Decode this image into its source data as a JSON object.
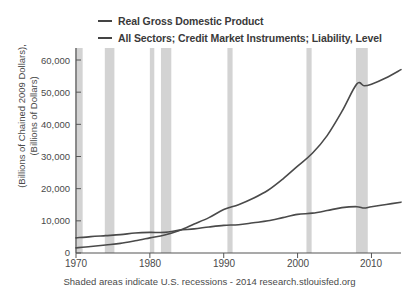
{
  "chart_data": {
    "type": "line",
    "title": "",
    "xlabel": "",
    "ylabel": "(Billions of Chained 2009 Dollars), (Billions of Dollars)",
    "ylabel_line1": "(Billions of Chained 2009 Dollars),",
    "ylabel_line2": "(Billions of Dollars)",
    "xlim": [
      1970,
      2014
    ],
    "ylim": [
      0,
      60000
    ],
    "grid": false,
    "legend_position": "top",
    "yticks": [
      "0",
      "10,000",
      "20,000",
      "30,000",
      "40,000",
      "50,000",
      "60,000"
    ],
    "ytick_values": [
      0,
      10000,
      20000,
      30000,
      40000,
      50000,
      60000
    ],
    "xticks": [
      "1970",
      "1980",
      "1990",
      "2000",
      "2010"
    ],
    "xtick_values": [
      1970,
      1980,
      1990,
      2000,
      2010
    ],
    "series": [
      {
        "name": "Real Gross Domestic Product",
        "color": "#4a4a4a",
        "x": [
          1970,
          1972,
          1974,
          1976,
          1978,
          1980,
          1982,
          1984,
          1986,
          1988,
          1990,
          1992,
          1994,
          1996,
          1998,
          2000,
          2002,
          2004,
          2006,
          2008,
          2009,
          2010,
          2012,
          2014
        ],
        "values": [
          4700,
          5100,
          5400,
          5700,
          6200,
          6400,
          6400,
          7100,
          7500,
          8100,
          8600,
          8800,
          9400,
          10000,
          11000,
          12000,
          12400,
          13200,
          14100,
          14400,
          14000,
          14400,
          15100,
          15800
        ]
      },
      {
        "name": "All Sectors; Credit Market Instruments; Liability, Level",
        "color": "#4a4a4a",
        "x": [
          1970,
          1972,
          1974,
          1976,
          1978,
          1980,
          1982,
          1984,
          1986,
          1988,
          1990,
          1992,
          1994,
          1996,
          1998,
          2000,
          2002,
          2004,
          2006,
          2008,
          2009,
          2010,
          2012,
          2014
        ],
        "values": [
          1600,
          2000,
          2500,
          3000,
          3800,
          4700,
          5600,
          7000,
          9000,
          11000,
          13500,
          15000,
          17000,
          19500,
          23000,
          27000,
          31000,
          36500,
          44000,
          52500,
          52000,
          52500,
          54500,
          57000
        ]
      }
    ],
    "recessions": [
      {
        "start": 1969.9,
        "end": 1970.9
      },
      {
        "start": 1973.9,
        "end": 1975.2
      },
      {
        "start": 1980.0,
        "end": 1980.6
      },
      {
        "start": 1981.5,
        "end": 1982.9
      },
      {
        "start": 1990.5,
        "end": 1991.2
      },
      {
        "start": 2001.2,
        "end": 2001.9
      },
      {
        "start": 2007.9,
        "end": 2009.5
      }
    ],
    "recession_color": "#d3d3d3",
    "axis_color": "#555555",
    "footnote": "Shaded areas indicate U.S. recessions - 2014 research.stlouisfed.org"
  },
  "legend": {
    "items": [
      {
        "label": "Real Gross Domestic Product"
      },
      {
        "label": "All Sectors; Credit Market Instruments; Liability, Level"
      }
    ]
  },
  "footer": {
    "text": "Shaded areas indicate U.S. recessions - 2014 research.stlouisfed.org"
  }
}
